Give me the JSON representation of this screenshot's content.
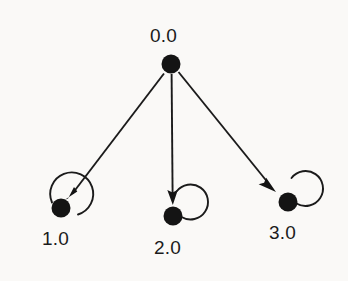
{
  "diagram": {
    "type": "state-transition-graph",
    "background_color": "#faf9f7",
    "ink_color": "#1b1b1b",
    "title": "",
    "nodes": [
      {
        "id": "root",
        "label": "0.0",
        "cx": 171,
        "cy": 64,
        "r": 9.5,
        "label_x": 150,
        "label_y": 26,
        "has_self_loop": false
      },
      {
        "id": "left",
        "label": "1.0",
        "cx": 61,
        "cy": 208,
        "r": 9.5,
        "label_x": 42,
        "label_y": 229,
        "has_self_loop": true
      },
      {
        "id": "middle",
        "label": "2.0",
        "cx": 173,
        "cy": 216,
        "r": 9.5,
        "label_x": 154,
        "label_y": 238,
        "has_self_loop": true
      },
      {
        "id": "right",
        "label": "3.0",
        "cx": 288,
        "cy": 202,
        "r": 9.5,
        "label_x": 269,
        "label_y": 223,
        "has_self_loop": true
      }
    ],
    "edges": [
      {
        "from": "root",
        "to": "left",
        "style": "straight-arrow"
      },
      {
        "from": "root",
        "to": "middle",
        "style": "straight-arrow"
      },
      {
        "from": "root",
        "to": "right",
        "style": "straight-arrow"
      },
      {
        "from": "left",
        "to": "left",
        "style": "self-loop"
      },
      {
        "from": "middle",
        "to": "middle",
        "style": "self-loop"
      },
      {
        "from": "right",
        "to": "right",
        "style": "self-loop"
      }
    ]
  }
}
